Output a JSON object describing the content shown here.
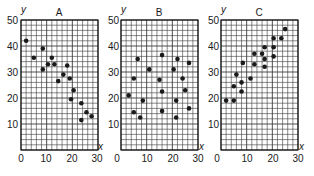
{
  "chart_data": [
    {
      "type": "scatter",
      "title": "A",
      "xlabel": "x",
      "ylabel": "y",
      "xlim": [
        0,
        30
      ],
      "ylim": [
        0,
        50
      ],
      "xticks": [
        "0",
        "10",
        "20",
        "30"
      ],
      "yticks": [
        "10",
        "20",
        "30",
        "40",
        "50"
      ],
      "grid": true,
      "points": [
        [
          2,
          42
        ],
        [
          5,
          35.5
        ],
        [
          8.5,
          39
        ],
        [
          8.5,
          31
        ],
        [
          10.5,
          33
        ],
        [
          12,
          35.5
        ],
        [
          13,
          33
        ],
        [
          14.5,
          26.5
        ],
        [
          16.5,
          29
        ],
        [
          18,
          32.5
        ],
        [
          19,
          27.5
        ],
        [
          20.5,
          23
        ],
        [
          19.5,
          19.5
        ],
        [
          23.5,
          18
        ],
        [
          25.5,
          14.5
        ],
        [
          27.5,
          13
        ],
        [
          23.5,
          11.5
        ]
      ]
    },
    {
      "type": "scatter",
      "title": "B",
      "xlabel": "x",
      "ylabel": "y",
      "xlim": [
        0,
        30
      ],
      "ylim": [
        0,
        50
      ],
      "xticks": [
        "0",
        "10",
        "20",
        "30"
      ],
      "yticks": [
        "10",
        "20",
        "30",
        "40",
        "50"
      ],
      "grid": true,
      "points": [
        [
          6.5,
          35
        ],
        [
          16,
          36.5
        ],
        [
          22,
          35
        ],
        [
          26.5,
          33.5
        ],
        [
          11,
          31
        ],
        [
          20.5,
          31
        ],
        [
          5,
          27.5
        ],
        [
          15,
          27
        ],
        [
          24,
          27.5
        ],
        [
          25,
          23
        ],
        [
          16,
          22.5
        ],
        [
          3,
          21
        ],
        [
          8.5,
          19
        ],
        [
          21.5,
          19
        ],
        [
          5,
          14.5
        ],
        [
          16,
          15
        ],
        [
          26.5,
          16
        ],
        [
          7.5,
          12.5
        ],
        [
          21.5,
          12.5
        ]
      ]
    },
    {
      "type": "scatter",
      "title": "C",
      "xlabel": "x",
      "ylabel": "y",
      "xlim": [
        0,
        30
      ],
      "ylim": [
        0,
        50
      ],
      "xticks": [
        "0",
        "10",
        "20",
        "30"
      ],
      "yticks": [
        "10",
        "20",
        "30",
        "40",
        "50"
      ],
      "grid": true,
      "points": [
        [
          25,
          46.5
        ],
        [
          20.5,
          43
        ],
        [
          23.5,
          43
        ],
        [
          17,
          39.5
        ],
        [
          20.5,
          39.5
        ],
        [
          13,
          37
        ],
        [
          16,
          37
        ],
        [
          17,
          35
        ],
        [
          20.5,
          36
        ],
        [
          8.5,
          33.5
        ],
        [
          13,
          33
        ],
        [
          17,
          32
        ],
        [
          6,
          29
        ],
        [
          11.5,
          27.5
        ],
        [
          8,
          26
        ],
        [
          5,
          24.5
        ],
        [
          8,
          22.5
        ],
        [
          2,
          19
        ],
        [
          5,
          19
        ]
      ]
    }
  ],
  "panels": [
    {
      "title": "A",
      "ylabel": "y",
      "xlabel": "x",
      "yticks": [
        "50",
        "40",
        "30",
        "20",
        "10"
      ],
      "xticks": [
        "0",
        "10",
        "20",
        "30"
      ]
    },
    {
      "title": "B",
      "ylabel": "y",
      "xlabel": "x",
      "yticks": [
        "50",
        "40",
        "30",
        "20",
        "10"
      ],
      "xticks": [
        "0",
        "10",
        "20",
        "30"
      ]
    },
    {
      "title": "C",
      "ylabel": "y",
      "xlabel": "x",
      "yticks": [
        "50",
        "40",
        "30",
        "20",
        "10"
      ],
      "xticks": [
        "0",
        "10",
        "20",
        "30"
      ]
    }
  ],
  "colors": {
    "grid": "#3a3a3a",
    "point": "#1a1a1a",
    "background": "#ffffff"
  }
}
